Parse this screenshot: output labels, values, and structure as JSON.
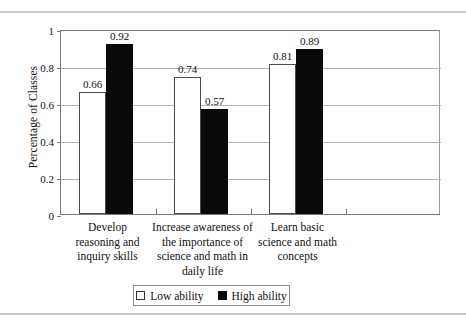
{
  "chart_data": {
    "type": "bar",
    "title": "",
    "xlabel": "",
    "ylabel": "Percentage of Classes",
    "ylim": [
      0,
      1
    ],
    "ytick_labels": [
      "0",
      "0.2",
      "0.4",
      "0.6",
      "0.8",
      "1"
    ],
    "ytick_values": [
      0,
      0.2,
      0.4,
      0.6,
      0.8,
      1
    ],
    "grid": true,
    "legend_position": "bottom",
    "categories": [
      "Develop reasoning and inquiry skills",
      "Increase awareness of the importance of science and math in daily life",
      "Learn basic science and math concepts"
    ],
    "category_lines": [
      [
        "Develop",
        "reasoning and",
        "inquiry skills"
      ],
      [
        "Increase awareness of",
        "the importance of",
        "science and math in",
        "daily life"
      ],
      [
        "Learn basic",
        "science and math",
        "concepts"
      ]
    ],
    "series": [
      {
        "name": "Low ability",
        "color": "#ffffff",
        "border_color": "#4a4a4a",
        "values": [
          0.66,
          0.74,
          0.81
        ],
        "labels": [
          "0.66",
          "0.74",
          "0.81"
        ]
      },
      {
        "name": "High ability",
        "color": "#0a0a0a",
        "border_color": "#0a0a0a",
        "values": [
          0.92,
          0.57,
          0.89
        ],
        "labels": [
          "0.92",
          "0.57",
          "0.89"
        ]
      }
    ]
  },
  "legend": {
    "items": [
      {
        "label": "Low ability",
        "swatch": "white-square-icon"
      },
      {
        "label": "High ability",
        "swatch": "black-square-icon"
      }
    ]
  }
}
